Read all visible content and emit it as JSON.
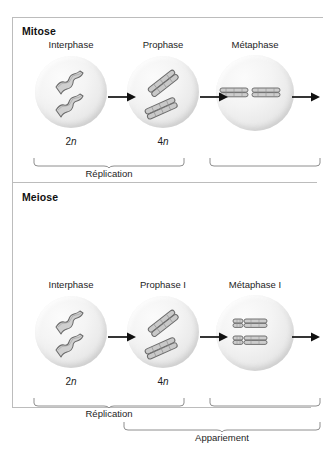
{
  "figure": {
    "sections": [
      {
        "id": "mitosis",
        "heading": "Mitose",
        "stages": [
          {
            "label": "Interphase",
            "ploidy_number": "2",
            "ploidy_symbol": "n",
            "cell_state": "interphase-chromatin"
          },
          {
            "label": "Prophase",
            "ploidy_number": "4",
            "ploidy_symbol": "n",
            "cell_state": "prophase-duplicated-chromosomes"
          },
          {
            "label": "Métaphase",
            "ploidy_number": "",
            "ploidy_symbol": "",
            "cell_state": "metaphase-equatorial-plate"
          }
        ],
        "arrows": 3,
        "braces": [
          {
            "label": "Réplication",
            "spans": "Interphase-Prophase"
          },
          {
            "label": "",
            "spans": "Métaphase"
          }
        ]
      },
      {
        "id": "meiosis",
        "heading": "Meiose",
        "stages": [
          {
            "label": "Interphase",
            "ploidy_number": "2",
            "ploidy_symbol": "n",
            "cell_state": "interphase-chromatin"
          },
          {
            "label": "Prophase I",
            "ploidy_number": "4",
            "ploidy_symbol": "n",
            "cell_state": "prophase-duplicated-chromosomes"
          },
          {
            "label": "Métaphase I",
            "ploidy_number": "",
            "ploidy_symbol": "",
            "cell_state": "metaphase-paired-bivalents"
          }
        ],
        "arrows": 3,
        "braces": [
          {
            "label": "Réplication",
            "spans": "Interphase-Prophase I"
          },
          {
            "label": "",
            "spans": "Métaphase I"
          },
          {
            "label": "Appariement",
            "spans": "Prophase I-Métaphase I"
          }
        ]
      }
    ]
  },
  "colors": {
    "panel_border": "#bcbcbc",
    "cell_fill_light": "#fbfbfb",
    "cell_fill_dark": "#d6d6d6",
    "chromosome_stroke": "#5a5a5a",
    "chromosome_fill": "#c9c9c9",
    "arrow": "#111111",
    "text": "#1a1a1a"
  }
}
